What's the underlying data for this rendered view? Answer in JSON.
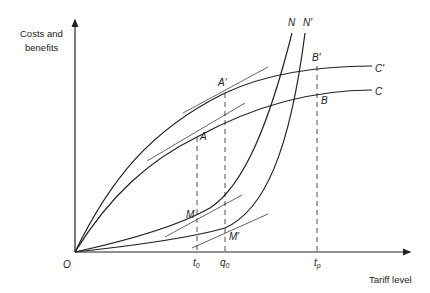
{
  "diagram": {
    "y_axis_label_line1": "Costs and",
    "y_axis_label_line2": "benefits",
    "x_axis_label": "Tariff level",
    "origin_label": "O",
    "curves": {
      "C": "C",
      "C_prime": "C′",
      "N": "N",
      "N_prime": "N′"
    },
    "points": {
      "A": "A",
      "A_prime": "A′",
      "B": "B",
      "B_prime": "B′",
      "M": "M",
      "M_prime": "M′"
    },
    "ticks": {
      "t0": "t",
      "t0_sub": "0",
      "q0": "q",
      "q0_sub": "0",
      "tp": "t",
      "tp_sub": "p"
    },
    "colors": {
      "line": "#222222",
      "background": "#ffffff"
    }
  }
}
